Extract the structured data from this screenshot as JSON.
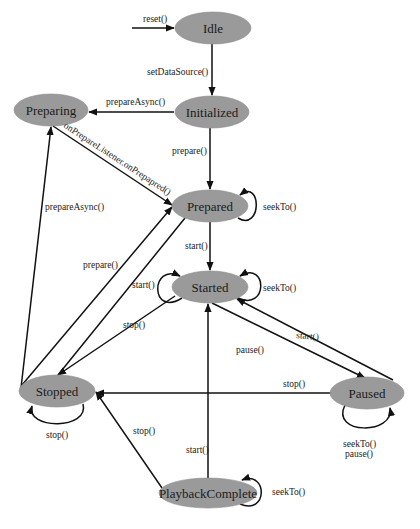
{
  "diagram": {
    "colors": {
      "node_fill": "#9a9a9a",
      "line": "#111111",
      "text": "#1a1a1a",
      "background": "#ffffff"
    },
    "nodes": [
      {
        "id": "idle",
        "label": "Idle",
        "cx": 213,
        "cy": 28,
        "rx": 38,
        "ry": 16
      },
      {
        "id": "initialized",
        "label": "Initialized",
        "cx": 212,
        "cy": 112,
        "rx": 37,
        "ry": 16
      },
      {
        "id": "preparing",
        "label": "Preparing",
        "cx": 51,
        "cy": 110,
        "rx": 37,
        "ry": 16
      },
      {
        "id": "prepared",
        "label": "Prepared",
        "cx": 210,
        "cy": 206,
        "rx": 38,
        "ry": 16
      },
      {
        "id": "started",
        "label": "Started",
        "cx": 210,
        "cy": 287,
        "rx": 38,
        "ry": 16
      },
      {
        "id": "paused",
        "label": "Paused",
        "cx": 367,
        "cy": 393,
        "rx": 37,
        "ry": 16
      },
      {
        "id": "stopped",
        "label": "Stopped",
        "cx": 57,
        "cy": 391,
        "rx": 38,
        "ry": 16
      },
      {
        "id": "playback_complete",
        "label": "PlaybackComplete",
        "cx": 208,
        "cy": 493,
        "rx": 49,
        "ry": 15
      }
    ],
    "edges": [
      {
        "from": "entry",
        "to": "idle",
        "label": "reset()"
      },
      {
        "from": "idle",
        "to": "initialized",
        "label": "setDataSource()"
      },
      {
        "from": "initialized",
        "to": "preparing",
        "label": "prepareAsync()"
      },
      {
        "from": "initialized",
        "to": "prepared",
        "label": "prepare()"
      },
      {
        "from": "preparing",
        "to": "prepared",
        "label": "onPrepareListener.onPrepapred()"
      },
      {
        "from": "prepared",
        "to": "prepared",
        "label": "seekTo()"
      },
      {
        "from": "prepared",
        "to": "started",
        "label": "start()"
      },
      {
        "from": "started",
        "to": "started",
        "label_left": "start()",
        "label_right": "seekTo()"
      },
      {
        "from": "started",
        "to": "paused",
        "label": "pause()"
      },
      {
        "from": "paused",
        "to": "started",
        "label": "start()"
      },
      {
        "from": "paused",
        "to": "paused",
        "label": "seekTo()\npause()"
      },
      {
        "from": "paused",
        "to": "stopped",
        "label": "stop()"
      },
      {
        "from": "started",
        "to": "stopped",
        "label": "stop()"
      },
      {
        "from": "prepared",
        "to": "stopped",
        "label": "stop()"
      },
      {
        "from": "stopped",
        "to": "prepared",
        "label": "prepare()"
      },
      {
        "from": "stopped",
        "to": "preparing",
        "label": "prepareAsync()"
      },
      {
        "from": "stopped",
        "to": "stopped",
        "label": "stop()"
      },
      {
        "from": "playback_complete",
        "to": "stopped",
        "label": "stop()"
      },
      {
        "from": "playback_complete",
        "to": "started",
        "label": "start()"
      },
      {
        "from": "playback_complete",
        "to": "playback_complete",
        "label": "seekTo()"
      }
    ],
    "labels": {
      "reset": "reset()",
      "set_data_source": "setDataSource()",
      "init_prepare_async": "prepareAsync()",
      "init_prepare": "prepare()",
      "on_prepared": "onPrepareListener.onPrepapred()",
      "prepared_seek": "seekTo()",
      "prepared_start": "start()",
      "started_start_loop": "start()",
      "started_seek": "seekTo()",
      "pause": "pause()",
      "paused_start": "start()",
      "paused_stop": "stop()",
      "paused_loop_1": "seekTo()",
      "paused_loop_2": "pause()",
      "started_stop": "stop()",
      "stopped_prepare": "prepare()",
      "stopped_prepare_async": "prepareAsync()",
      "stopped_loop": "stop()",
      "complete_stop": "stop()",
      "complete_start": "start()",
      "complete_seek": "seekTo()"
    }
  }
}
